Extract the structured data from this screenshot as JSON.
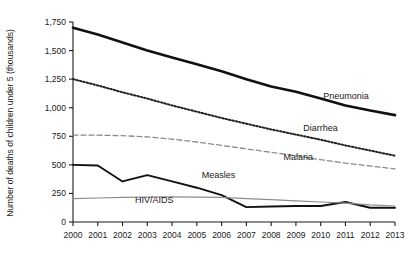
{
  "chart_data": {
    "type": "line",
    "title": "",
    "xlabel": "",
    "ylabel": "Number of deaths of children under 5 (thousands)",
    "x": [
      2000,
      2001,
      2002,
      2003,
      2004,
      2005,
      2006,
      2007,
      2008,
      2009,
      2010,
      2011,
      2012,
      2013
    ],
    "xtick_labels": [
      "2000",
      "2001",
      "2002",
      "2003",
      "2004",
      "2005",
      "2006",
      "2007",
      "2008",
      "2009",
      "2010",
      "2011",
      "2012",
      "2013"
    ],
    "ytick_labels": [
      "0",
      "250",
      "500",
      "750",
      "1,000",
      "1,250",
      "1,500",
      "1,750"
    ],
    "ytick_values": [
      0,
      250,
      500,
      750,
      1000,
      1250,
      1500,
      1750
    ],
    "ylim": [
      0,
      1750
    ],
    "xlim": [
      2000,
      2013
    ],
    "grid": false,
    "legend_position": "inline-labels",
    "series": [
      {
        "name": "Pneumonia",
        "style": "solid-bold",
        "color": "#111111",
        "label_x": 2010.1,
        "label_y": 1080,
        "values": [
          1700,
          1640,
          1570,
          1500,
          1440,
          1380,
          1320,
          1250,
          1185,
          1140,
          1080,
          1020,
          975,
          935
        ]
      },
      {
        "name": "Diarrhea",
        "style": "dotted",
        "color": "#222222",
        "label_x": 2009.3,
        "label_y": 800,
        "values": [
          1250,
          1195,
          1135,
          1080,
          1020,
          965,
          910,
          860,
          810,
          765,
          720,
          670,
          625,
          580
        ]
      },
      {
        "name": "Malaria",
        "style": "dashed",
        "color": "#8c8c8c",
        "label_x": 2008.5,
        "label_y": 540,
        "values": [
          760,
          760,
          755,
          745,
          725,
          700,
          670,
          640,
          610,
          580,
          545,
          515,
          490,
          465
        ]
      },
      {
        "name": "Measles",
        "style": "solid",
        "color": "#111111",
        "label_x": 2005.2,
        "label_y": 385,
        "values": [
          500,
          495,
          355,
          410,
          355,
          300,
          235,
          130,
          135,
          140,
          140,
          175,
          125,
          125
        ]
      },
      {
        "name": "HIV/AIDS",
        "style": "solid-thin",
        "color": "#8c8c8c",
        "label_x": 2002.5,
        "label_y": 170,
        "values": [
          205,
          210,
          215,
          218,
          220,
          218,
          215,
          205,
          195,
          185,
          175,
          165,
          150,
          140
        ]
      }
    ]
  }
}
